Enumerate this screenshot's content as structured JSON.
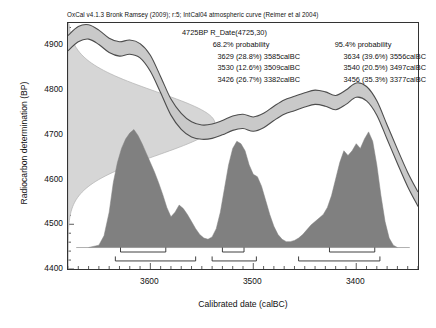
{
  "credit": "OxCal v4.1.3 Bronk Ramsey (2009); r:5; IntCal04 atmospheric curve (Reimer et al 2004)",
  "stats": {
    "title": "4725BP R_Date(4725,30)",
    "header_68": "68.2% probability",
    "header_95": "95.4% probability",
    "rows_68": [
      "3629 (28.8%) 3585calBC",
      "3530 (12.6%) 3509calBC",
      "3426 (26.7%) 3382calBC"
    ],
    "rows_95": [
      "3634 (39.6%) 3556calBC",
      "3540 (20.5%) 3497calBC",
      "3456 (35.3%) 3377calBC"
    ]
  },
  "colors": {
    "band_fill": "#c9c9c9",
    "band_edge": "#4d4d4d",
    "posterior_fill": "#808080",
    "likelihood_fill": "#d6d6d6",
    "axis": "#333333",
    "text": "#111111"
  },
  "chart_data": {
    "type": "area",
    "title": "4725BP R_Date(4725,30)",
    "xlabel": "Calibrated date (calBC)",
    "ylabel": "Radiocarbon determination (BP)",
    "xlim": [
      3680,
      3340
    ],
    "ylim": [
      4400,
      4950
    ],
    "x_ticks": [
      3600,
      3500,
      3400
    ],
    "y_ticks": [
      4400,
      4500,
      4600,
      4700,
      4800,
      4900
    ],
    "x_axis_direction": "decreasing",
    "grid": false,
    "legend": "none",
    "measurement": {
      "label": "4725BP",
      "value": 4725,
      "error": 30
    },
    "series": [
      {
        "name": "IntCal04 calibration curve (±1σ band)",
        "type": "band",
        "x": [
          3680,
          3670,
          3660,
          3650,
          3640,
          3630,
          3620,
          3610,
          3600,
          3590,
          3580,
          3570,
          3560,
          3550,
          3540,
          3530,
          3520,
          3510,
          3500,
          3490,
          3480,
          3470,
          3460,
          3450,
          3440,
          3430,
          3420,
          3410,
          3400,
          3390,
          3380,
          3370,
          3360,
          3350,
          3340
        ],
        "y_mid": [
          4905,
          4925,
          4930,
          4918,
          4900,
          4892,
          4896,
          4888,
          4860,
          4812,
          4762,
          4730,
          4712,
          4706,
          4708,
          4716,
          4726,
          4730,
          4724,
          4732,
          4748,
          4762,
          4770,
          4778,
          4784,
          4780,
          4772,
          4784,
          4800,
          4792,
          4760,
          4706,
          4652,
          4600,
          4556
        ],
        "y_upper": [
          4922,
          4942,
          4946,
          4934,
          4916,
          4908,
          4912,
          4904,
          4878,
          4830,
          4780,
          4748,
          4729,
          4722,
          4724,
          4732,
          4742,
          4746,
          4740,
          4748,
          4764,
          4778,
          4786,
          4794,
          4800,
          4796,
          4788,
          4800,
          4816,
          4808,
          4776,
          4722,
          4668,
          4616,
          4572
        ],
        "y_lower": [
          4888,
          4908,
          4914,
          4902,
          4884,
          4876,
          4880,
          4872,
          4842,
          4794,
          4744,
          4712,
          4695,
          4690,
          4692,
          4700,
          4710,
          4714,
          4708,
          4716,
          4732,
          4746,
          4754,
          4762,
          4768,
          4764,
          4756,
          4768,
          4784,
          4776,
          4744,
          4690,
          4636,
          4584,
          4540
        ]
      },
      {
        "name": "Measurement likelihood (normal, 4725±30 BP)",
        "type": "likelihood",
        "orientation": "horizontal",
        "mean": 4725,
        "sigma": 30,
        "note": "plotted against the BP axis at the left edge"
      },
      {
        "name": "Calibrated posterior probability distribution",
        "type": "posterior",
        "x": [
          3660,
          3650,
          3645,
          3640,
          3636,
          3632,
          3628,
          3624,
          3620,
          3616,
          3612,
          3608,
          3604,
          3600,
          3596,
          3592,
          3588,
          3584,
          3580,
          3576,
          3572,
          3568,
          3564,
          3560,
          3556,
          3552,
          3548,
          3544,
          3540,
          3536,
          3532,
          3528,
          3524,
          3520,
          3516,
          3512,
          3508,
          3504,
          3500,
          3496,
          3492,
          3488,
          3484,
          3480,
          3476,
          3472,
          3468,
          3464,
          3460,
          3456,
          3452,
          3448,
          3444,
          3440,
          3436,
          3432,
          3428,
          3424,
          3420,
          3416,
          3412,
          3408,
          3404,
          3400,
          3396,
          3392,
          3388,
          3384,
          3380,
          3376,
          3372,
          3368,
          3364,
          3360
        ],
        "density": [
          0.0,
          0.02,
          0.1,
          0.3,
          0.55,
          0.72,
          0.84,
          0.92,
          0.97,
          1.0,
          0.95,
          0.88,
          0.8,
          0.72,
          0.64,
          0.55,
          0.45,
          0.34,
          0.26,
          0.3,
          0.36,
          0.33,
          0.28,
          0.22,
          0.16,
          0.11,
          0.08,
          0.07,
          0.09,
          0.16,
          0.3,
          0.5,
          0.7,
          0.84,
          0.9,
          0.88,
          0.82,
          0.7,
          0.62,
          0.6,
          0.52,
          0.4,
          0.28,
          0.18,
          0.11,
          0.07,
          0.05,
          0.05,
          0.06,
          0.08,
          0.11,
          0.15,
          0.19,
          0.22,
          0.25,
          0.28,
          0.34,
          0.44,
          0.58,
          0.72,
          0.82,
          0.78,
          0.82,
          0.88,
          0.84,
          0.92,
          0.98,
          0.9,
          0.7,
          0.44,
          0.22,
          0.08,
          0.02,
          0.0
        ]
      }
    ],
    "ranges": [
      {
        "level": "68.2%",
        "row": 1,
        "segments": [
          {
            "from": 3629,
            "to": 3585,
            "probability": 28.8
          },
          {
            "from": 3530,
            "to": 3509,
            "probability": 12.6
          },
          {
            "from": 3426,
            "to": 3382,
            "probability": 26.7
          }
        ]
      },
      {
        "level": "95.4%",
        "row": 2,
        "segments": [
          {
            "from": 3634,
            "to": 3556,
            "probability": 39.6
          },
          {
            "from": 3540,
            "to": 3497,
            "probability": 20.5
          },
          {
            "from": 3456,
            "to": 3377,
            "probability": 35.3
          }
        ]
      }
    ]
  }
}
